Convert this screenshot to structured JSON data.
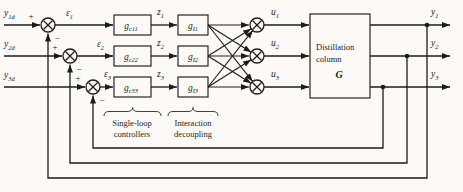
{
  "figure": {
    "colors": {
      "paper": "#fbfaf6",
      "ink": "#1c1c1c"
    },
    "signs": {
      "plus": "+",
      "minus": "−"
    },
    "rows": [
      {
        "setpoint": {
          "base": "y",
          "sub": "1d"
        },
        "error": {
          "base": "ε",
          "sub": "1"
        },
        "controller": {
          "base": "g",
          "sub": "c11"
        },
        "controller_out": {
          "base": "z",
          "sub": "1"
        },
        "decoupler": {
          "base": "g",
          "sub": "I1"
        },
        "control": {
          "base": "u",
          "sub": "1"
        },
        "output": {
          "base": "y",
          "sub": "1"
        }
      },
      {
        "setpoint": {
          "base": "y",
          "sub": "2d"
        },
        "error": {
          "base": "ε",
          "sub": "2"
        },
        "controller": {
          "base": "g",
          "sub": "c22"
        },
        "controller_out": {
          "base": "z",
          "sub": "2"
        },
        "decoupler": {
          "base": "g",
          "sub": "I2"
        },
        "control": {
          "base": "u",
          "sub": "2"
        },
        "output": {
          "base": "y",
          "sub": "2"
        }
      },
      {
        "setpoint": {
          "base": "y",
          "sub": "3d"
        },
        "error": {
          "base": "ε",
          "sub": "3"
        },
        "controller": {
          "base": "g",
          "sub": "c33"
        },
        "controller_out": {
          "base": "z",
          "sub": "3"
        },
        "decoupler": {
          "base": "g",
          "sub": "I3"
        },
        "control": {
          "base": "u",
          "sub": "3"
        },
        "output": {
          "base": "y",
          "sub": "3"
        }
      }
    ],
    "plant": {
      "line1": "Distillation",
      "line2": "column",
      "symbol": "G"
    },
    "captions": {
      "controllers": {
        "line1": "Single-loop",
        "line2": "controllers"
      },
      "decoupling": {
        "line1": "Interaction",
        "line2": "decoupling"
      }
    }
  }
}
